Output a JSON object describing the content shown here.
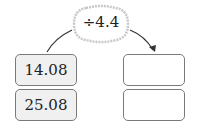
{
  "operation": {
    "label": "÷4.4"
  },
  "inputs": [
    {
      "value": "14.08"
    },
    {
      "value": "25.08"
    }
  ],
  "outputs": [
    {
      "value": ""
    },
    {
      "value": ""
    }
  ],
  "colors": {
    "box_border": "#7a7a7a",
    "filled_bg": "#f0f0f0",
    "cloud_border": "#c8c8c8"
  }
}
